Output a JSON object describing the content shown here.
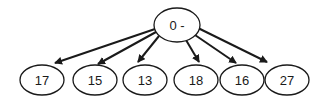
{
  "diagram": {
    "type": "tree",
    "stroke_color": "#1a1a1a",
    "background": "#ffffff",
    "root": {
      "id": "root",
      "label": "0 -",
      "cx": 177,
      "cy": 25,
      "rx": 23,
      "ry": 17
    },
    "children": [
      {
        "id": "c1",
        "label": "17",
        "cx": 42,
        "cy": 80,
        "rx": 22,
        "ry": 15
      },
      {
        "id": "c2",
        "label": "15",
        "cx": 95,
        "cy": 80,
        "rx": 22,
        "ry": 15
      },
      {
        "id": "c3",
        "label": "13",
        "cx": 145,
        "cy": 80,
        "rx": 22,
        "ry": 15
      },
      {
        "id": "c4",
        "label": "18",
        "cx": 196,
        "cy": 80,
        "rx": 22,
        "ry": 15
      },
      {
        "id": "c5",
        "label": "16",
        "cx": 242,
        "cy": 80,
        "rx": 22,
        "ry": 15
      },
      {
        "id": "c6",
        "label": "27",
        "cx": 287,
        "cy": 80,
        "rx": 22,
        "ry": 15
      }
    ],
    "edges": [
      {
        "from": "root",
        "to": "c1",
        "x1": 155,
        "y1": 29,
        "x2": 55,
        "y2": 63
      },
      {
        "from": "root",
        "to": "c2",
        "x1": 156,
        "y1": 32,
        "x2": 98,
        "y2": 64
      },
      {
        "from": "root",
        "to": "c3",
        "x1": 159,
        "y1": 36,
        "x2": 138,
        "y2": 62
      },
      {
        "from": "root",
        "to": "c4",
        "x1": 186,
        "y1": 40,
        "x2": 199,
        "y2": 62
      },
      {
        "from": "root",
        "to": "c5",
        "x1": 195,
        "y1": 35,
        "x2": 236,
        "y2": 63
      },
      {
        "from": "root",
        "to": "c6",
        "x1": 198,
        "y1": 28,
        "x2": 267,
        "y2": 62
      }
    ]
  }
}
